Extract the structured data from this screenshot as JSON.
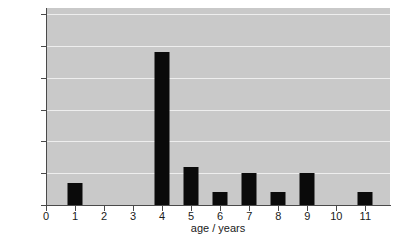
{
  "chart_data": {
    "type": "bar",
    "title": "",
    "subtitle": "",
    "xlabel": "age / years",
    "ylabel": "percentage of finches",
    "categories": [
      "1",
      "2",
      "3",
      "4",
      "5",
      "6",
      "7",
      "8",
      "9",
      "10",
      "11"
    ],
    "values": [
      7,
      0,
      0,
      48,
      12,
      4,
      10,
      4,
      10,
      0,
      4
    ],
    "series": [
      {
        "name": "percentage of finches",
        "values": [
          7,
          0,
          0,
          48,
          12,
          4,
          10,
          4,
          10,
          0,
          4
        ]
      }
    ],
    "xlim": [
      0,
      11.85
    ],
    "ylim": [
      0,
      62
    ],
    "x_ticks": [
      "0",
      "1",
      "2",
      "3",
      "4",
      "5",
      "6",
      "7",
      "8",
      "9",
      "10",
      "11"
    ],
    "x_tick_values": [
      0,
      1,
      2,
      3,
      4,
      5,
      6,
      7,
      8,
      9,
      10,
      11
    ],
    "y_ticks": [
      "0",
      "10",
      "20",
      "30",
      "40",
      "50",
      "60"
    ],
    "y_tick_values": [
      0,
      10,
      20,
      30,
      40,
      50,
      60
    ],
    "grid": true,
    "grid_axis": "y",
    "legend": false,
    "legend_position": "none",
    "annotations": [],
    "colors": {
      "bar": "#0a0a0a",
      "plot_background": "#c9c9c9",
      "gridline": "#eeeeee",
      "axis": "#4a4a4a",
      "text": "#1a1a1a",
      "figure_background": "#ffffff"
    }
  }
}
